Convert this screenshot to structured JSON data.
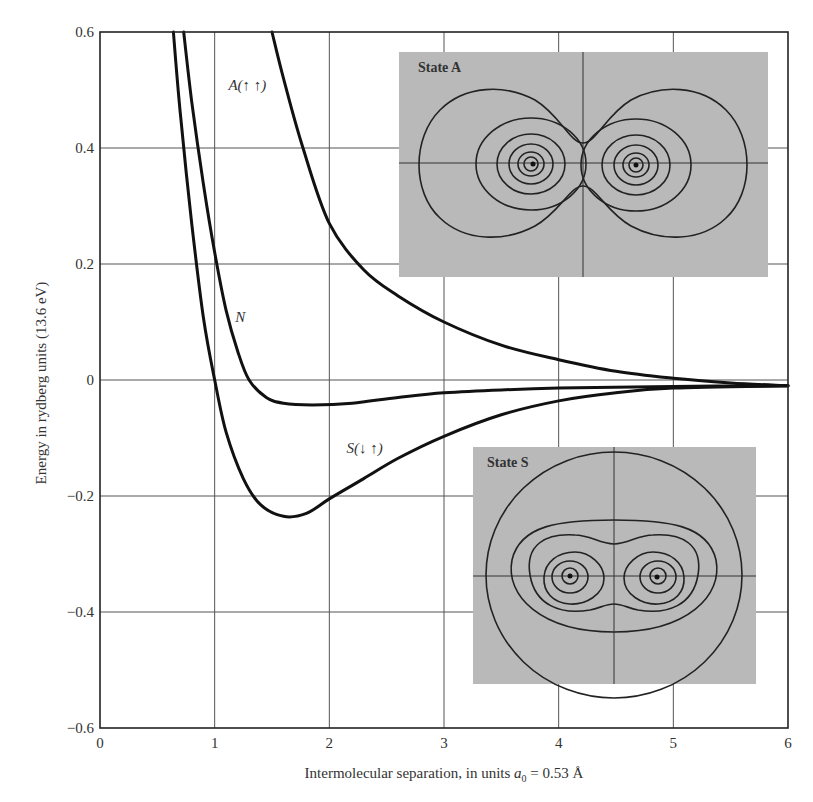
{
  "chart_data": {
    "type": "line",
    "title": "",
    "xlabel": "Intermolecular separation, in units a₀ = 0.53 Å",
    "xlabel_parts": {
      "prefix": "Intermolecular separation, in units ",
      "symbol": "a",
      "subscript": "0",
      "suffix": " = 0.53 Å"
    },
    "ylabel": "Energy in rydberg units (13.6 eV)",
    "xlim": [
      0,
      6
    ],
    "ylim": [
      -0.6,
      0.6
    ],
    "grid": true,
    "x_ticks": [
      "0",
      "1",
      "2",
      "3",
      "4",
      "5",
      "6"
    ],
    "y_ticks": [
      "0.6",
      "0.4",
      "0.2",
      "0",
      "−0.2",
      "−0.4",
      "−0.6"
    ],
    "series": [
      {
        "name": "A(↑ ↑)",
        "label": "A(↑ ↑)",
        "x": [
          1.5,
          1.6,
          1.77,
          2.0,
          2.3,
          2.6,
          3.0,
          3.5,
          4.0,
          4.5,
          5.0,
          5.5,
          6.0
        ],
        "y": [
          0.6,
          0.52,
          0.4,
          0.27,
          0.19,
          0.145,
          0.1,
          0.06,
          0.035,
          0.015,
          0.003,
          -0.005,
          -0.01
        ]
      },
      {
        "name": "N",
        "label": "N",
        "x": [
          0.73,
          0.8,
          0.9,
          1.0,
          1.1,
          1.2,
          1.3,
          1.45,
          1.6,
          1.85,
          2.2,
          2.6,
          3.0,
          3.5,
          4.0,
          5.0,
          6.0
        ],
        "y": [
          0.6,
          0.48,
          0.34,
          0.22,
          0.12,
          0.05,
          0.0,
          -0.03,
          -0.04,
          -0.043,
          -0.04,
          -0.03,
          -0.022,
          -0.017,
          -0.014,
          -0.011,
          -0.01
        ]
      },
      {
        "name": "S(↓ ↑)",
        "label": "S(↓ ↑)",
        "x": [
          0.64,
          0.7,
          0.8,
          0.9,
          1.0,
          1.1,
          1.25,
          1.4,
          1.6,
          1.8,
          2.0,
          2.3,
          2.6,
          3.0,
          3.5,
          4.0,
          4.5,
          5.0,
          6.0
        ],
        "y": [
          0.6,
          0.46,
          0.27,
          0.11,
          0.0,
          -0.09,
          -0.17,
          -0.215,
          -0.235,
          -0.23,
          -0.205,
          -0.17,
          -0.135,
          -0.097,
          -0.06,
          -0.036,
          -0.022,
          -0.014,
          -0.01
        ]
      }
    ],
    "annotations": [
      {
        "text": "A(↑ ↑)",
        "x": 1.12,
        "y": 0.5
      },
      {
        "text": "N",
        "x": 1.18,
        "y": 0.1
      },
      {
        "text": "S(↓ ↑)",
        "x": 2.15,
        "y": -0.125
      }
    ],
    "insets": [
      {
        "title": "State A",
        "description": "Contour plot of electron density for antisymmetric state: two separated sets of concentric contours around each nucleus with a node between them"
      },
      {
        "title": "State S",
        "description": "Contour plot of electron density for symmetric state: contours around both nuclei merged into a shared enclosing envelope"
      }
    ]
  }
}
